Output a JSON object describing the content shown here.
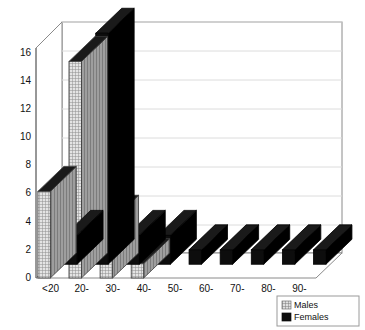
{
  "chart_data": {
    "type": "bar",
    "title": "",
    "subtitle": "",
    "xlabel": "",
    "ylabel": "",
    "categories": [
      "<20",
      "20-",
      "30-",
      "40-",
      "50-",
      "60-",
      "70-",
      "80-",
      "90-"
    ],
    "series": [
      {
        "name": "Males",
        "values": [
          6,
          15,
          4,
          1,
          0,
          0,
          0,
          0,
          0
        ]
      },
      {
        "name": "Females",
        "values": [
          2,
          16,
          2,
          2,
          1,
          1,
          1,
          1,
          1
        ]
      }
    ],
    "ylim": [
      0,
      16
    ],
    "yticks": [
      0,
      2,
      4,
      6,
      8,
      10,
      12,
      14,
      16
    ],
    "ytick_labels": [
      "0",
      "2",
      "4",
      "6",
      "8",
      "10",
      "12",
      "14",
      "16"
    ],
    "grid": true,
    "grid_axis": "y",
    "three_d": true,
    "legend_position": "bottom-right",
    "legend": [
      {
        "label": "Males",
        "swatch": "hatched-light",
        "color": "#d9d9d9"
      },
      {
        "label": "Females",
        "swatch": "solid-black",
        "color": "#0a0a0a"
      }
    ]
  },
  "colors": {
    "males_face": "#d4d4d4",
    "males_top": "#1a1a1a",
    "males_side": "#2b2b2b",
    "females_face": "#0d0d0d",
    "females_top": "#1a1a1a",
    "females_side": "#000000",
    "axis": "#6b6b6b",
    "grid": "#d6d6d6",
    "frame": "#8a8a8a",
    "text": "#111111",
    "background": "#ffffff",
    "legend_border": "#9a9a9a"
  },
  "legend_box": {
    "males_label": "Males",
    "females_label": "Females"
  }
}
